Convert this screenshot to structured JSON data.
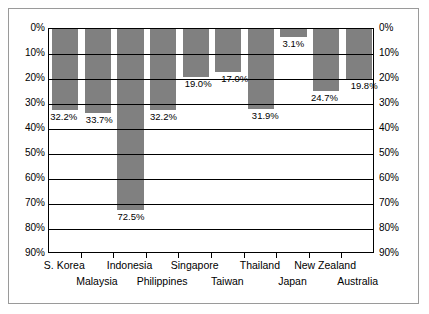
{
  "chart_data": {
    "type": "bar",
    "title": "",
    "subtitle": "",
    "xlabel": "",
    "ylabel": "",
    "categories": [
      "S. Korea",
      "Malaysia",
      "Indonesia",
      "Philippines",
      "Singapore",
      "Taiwan",
      "Thailand",
      "Japan",
      "New Zealand",
      "Australia"
    ],
    "values": [
      32.2,
      33.7,
      72.5,
      32.2,
      19.0,
      17.0,
      31.9,
      3.1,
      24.7,
      19.8
    ],
    "data_labels": [
      "32.2%",
      "33.7%",
      "72.5%",
      "32.2%",
      "19.0%",
      "17.0%",
      "31.9%",
      "3.1%",
      "24.7%",
      "19.8%"
    ],
    "ylim": [
      0,
      90
    ],
    "y_inverted": true,
    "ytick_values": [
      0,
      10,
      20,
      30,
      40,
      50,
      60,
      70,
      80,
      90
    ],
    "ytick_labels": [
      "0%",
      "10%",
      "20%",
      "30%",
      "40%",
      "50%",
      "60%",
      "70%",
      "80%",
      "90%"
    ],
    "right_axis_labels": [
      "0%",
      "10%",
      "20%",
      "30%",
      "40%",
      "50%",
      "60%",
      "70%",
      "80%",
      "90%"
    ],
    "grid": true,
    "legend": null,
    "bar_color": "#808080",
    "grid_color": "#000000",
    "axis_color": "#000000",
    "background_color": "#ffffff",
    "frame_color": "#9a9a9a"
  }
}
